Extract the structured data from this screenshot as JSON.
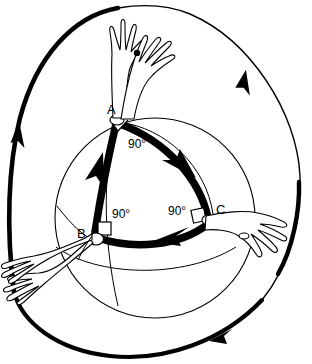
{
  "figure": {
    "background_color": "#ffffff",
    "stroke_color": "#000000",
    "vertices": [
      {
        "id": "A",
        "label": "A",
        "x": 116,
        "y": 122,
        "angle_label": "90°",
        "angle_value": 90
      },
      {
        "id": "B",
        "label": "B",
        "x": 95,
        "y": 238,
        "angle_label": "90°",
        "angle_value": 90
      },
      {
        "id": "C",
        "label": "C",
        "x": 208,
        "y": 219,
        "angle_label": "90°",
        "angle_value": 90
      }
    ],
    "angle_labels": [
      {
        "for_vertex": "A",
        "text": "90°"
      },
      {
        "for_vertex": "B",
        "text": "90°"
      },
      {
        "for_vertex": "C",
        "text": "90°"
      }
    ],
    "edges": [
      {
        "from": "A",
        "to": "B",
        "arrow": "toward-B",
        "style": "thick-black"
      },
      {
        "from": "B",
        "to": "C",
        "arrow": "toward-C",
        "style": "thick-black"
      },
      {
        "from": "C",
        "to": "A",
        "arrow": "toward-A",
        "style": "thick-black"
      }
    ],
    "sphere": {
      "center_x": 155,
      "center_y": 218,
      "radius": 100,
      "style": "thin-outline"
    },
    "outer_arcs": [
      {
        "id": "left-arc",
        "arrow_direction": "downward",
        "style": "thick-black"
      },
      {
        "id": "right-arc",
        "arrow_direction": "upward",
        "style": "thin-black"
      },
      {
        "id": "bottom-arc",
        "arrow_direction": "rightward",
        "style": "thick-black"
      }
    ],
    "arms": [
      {
        "id": "arm-at-A-left",
        "at_vertex": "A",
        "direction": "up"
      },
      {
        "id": "arm-at-A-right",
        "at_vertex": "A",
        "direction": "up-right"
      },
      {
        "id": "arm-at-B-lower",
        "at_vertex": "B",
        "direction": "down-left"
      },
      {
        "id": "arm-at-B-outer",
        "at_vertex": "B",
        "direction": "left"
      },
      {
        "id": "arm-at-C",
        "at_vertex": "C",
        "direction": "right"
      }
    ]
  }
}
